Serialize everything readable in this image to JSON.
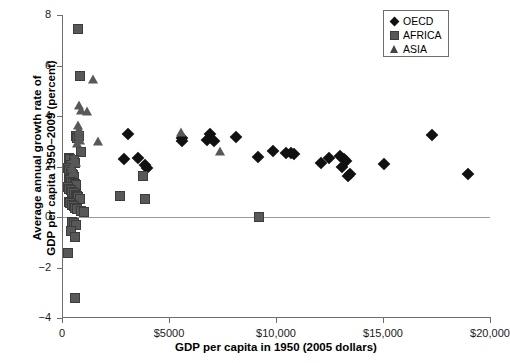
{
  "chart_data": {
    "type": "scatter",
    "title": "",
    "xlabel": "GDP per capita in 1950 (2005 dollars)",
    "ylabel_line1": "Average annual growth rate of",
    "ylabel_line2": "GDP per capita 1950–2009 (percent)",
    "xlim": [
      0,
      20000
    ],
    "ylim": [
      -4,
      8
    ],
    "xticks": [
      0,
      5000,
      10000,
      15000,
      20000
    ],
    "xticklabels": [
      "0",
      "$5000",
      "$10,000",
      "$15,000",
      "$20,000"
    ],
    "yticks": [
      -4,
      -2,
      0,
      2,
      4,
      6,
      8
    ],
    "yticklabels": [
      "−4",
      "−2",
      "0",
      "2",
      "4",
      "6",
      "8"
    ],
    "grid": false,
    "zero_reference_line": true,
    "legend_position": "top-right",
    "series": [
      {
        "name": "OECD",
        "marker": "diamond",
        "color": "#111111",
        "points": [
          [
            3080,
            3.28
          ],
          [
            2880,
            2.28
          ],
          [
            3560,
            2.35
          ],
          [
            3960,
            1.93
          ],
          [
            3890,
            2.05
          ],
          [
            5620,
            3.02
          ],
          [
            5600,
            3.12
          ],
          [
            6930,
            3.28
          ],
          [
            6780,
            3.05
          ],
          [
            7080,
            3.02
          ],
          [
            8120,
            3.18
          ],
          [
            9180,
            2.38
          ],
          [
            9840,
            2.62
          ],
          [
            10450,
            2.52
          ],
          [
            10700,
            2.55
          ],
          [
            10850,
            2.5
          ],
          [
            12100,
            2.12
          ],
          [
            12480,
            2.35
          ],
          [
            13000,
            2.42
          ],
          [
            13180,
            2.3
          ],
          [
            13280,
            2.2
          ],
          [
            13100,
            1.98
          ],
          [
            13450,
            1.72
          ],
          [
            13350,
            1.62
          ],
          [
            15050,
            2.08
          ],
          [
            17300,
            3.25
          ],
          [
            18950,
            1.7
          ]
        ]
      },
      {
        "name": "AFRICA",
        "marker": "square",
        "color": "#585858",
        "points": [
          [
            760,
            7.45
          ],
          [
            820,
            5.6
          ],
          [
            640,
            3.2
          ],
          [
            700,
            3.12
          ],
          [
            780,
            3.22
          ],
          [
            900,
            2.58
          ],
          [
            330,
            2.35
          ],
          [
            360,
            2.3
          ],
          [
            540,
            2.25
          ],
          [
            620,
            2.15
          ],
          [
            430,
            2.05
          ],
          [
            300,
            1.95
          ],
          [
            350,
            1.85
          ],
          [
            400,
            1.8
          ],
          [
            470,
            1.72
          ],
          [
            520,
            1.68
          ],
          [
            560,
            1.6
          ],
          [
            330,
            1.52
          ],
          [
            380,
            1.45
          ],
          [
            440,
            1.4
          ],
          [
            500,
            1.35
          ],
          [
            600,
            1.3
          ],
          [
            660,
            1.25
          ],
          [
            300,
            1.18
          ],
          [
            350,
            1.12
          ],
          [
            420,
            1.05
          ],
          [
            470,
            1.0
          ],
          [
            560,
            0.95
          ],
          [
            640,
            0.88
          ],
          [
            700,
            0.82
          ],
          [
            760,
            0.78
          ],
          [
            840,
            0.72
          ],
          [
            310,
            0.6
          ],
          [
            390,
            0.55
          ],
          [
            480,
            0.48
          ],
          [
            560,
            0.42
          ],
          [
            620,
            0.35
          ],
          [
            700,
            0.3
          ],
          [
            900,
            0.22
          ],
          [
            1050,
            0.18
          ],
          [
            480,
            -0.18
          ],
          [
            560,
            -0.25
          ],
          [
            640,
            -0.32
          ],
          [
            420,
            -0.55
          ],
          [
            600,
            -0.78
          ],
          [
            280,
            -1.42
          ],
          [
            620,
            -3.22
          ],
          [
            2700,
            0.85
          ],
          [
            3800,
            1.62
          ],
          [
            3900,
            0.72
          ],
          [
            9200,
            0.0
          ]
        ]
      },
      {
        "name": "ASIA",
        "marker": "triangle",
        "color": "#585858",
        "points": [
          [
            1430,
            5.45
          ],
          [
            780,
            4.45
          ],
          [
            900,
            4.22
          ],
          [
            1180,
            4.18
          ],
          [
            760,
            3.65
          ],
          [
            800,
            3.48
          ],
          [
            790,
            3.3
          ],
          [
            820,
            3.05
          ],
          [
            700,
            2.95
          ],
          [
            1700,
            3.02
          ],
          [
            540,
            2.32
          ],
          [
            600,
            2.22
          ],
          [
            660,
            2.18
          ],
          [
            480,
            1.95
          ],
          [
            520,
            1.78
          ],
          [
            5580,
            3.35
          ],
          [
            7400,
            2.62
          ]
        ]
      }
    ]
  },
  "legend": {
    "items": [
      {
        "label": "OECD",
        "marker": "diamond"
      },
      {
        "label": "AFRICA",
        "marker": "square"
      },
      {
        "label": "ASIA",
        "marker": "triangle"
      }
    ]
  }
}
